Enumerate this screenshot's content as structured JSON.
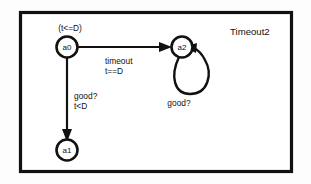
{
  "diagram": {
    "title": "Timeout2",
    "states": [
      {
        "id": "a0",
        "label": "a0",
        "invariant": "(t<=D)"
      },
      {
        "id": "a1",
        "label": "a1",
        "invariant": ""
      },
      {
        "id": "a2",
        "label": "a2",
        "invariant": ""
      }
    ],
    "transitions": [
      {
        "id": "a0-to-a2",
        "from": "a0",
        "to": "a2",
        "sync": "timeout",
        "guard": "t==D"
      },
      {
        "id": "a0-to-a1",
        "from": "a0",
        "to": "a1",
        "sync": "good?",
        "guard": "t<D"
      },
      {
        "id": "a2-self-loop",
        "from": "a2",
        "to": "a2",
        "sync": "good?",
        "guard": ""
      }
    ],
    "colors": {
      "ink": "#111111",
      "page": "#ffffff",
      "canvas": "#fdfdfd"
    }
  }
}
